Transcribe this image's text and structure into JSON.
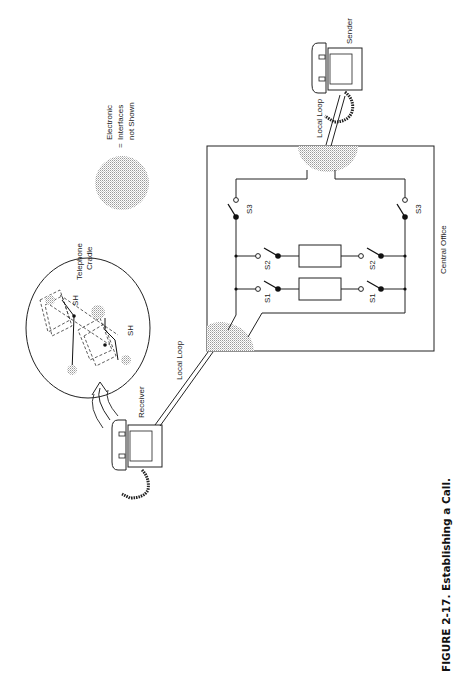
{
  "figure": {
    "caption": "FIGURE 2-17.  Establishing a Call.",
    "orientation": "rotated 90° counter-clockwise"
  },
  "legend": {
    "symbol": "stippled-circle",
    "equals": "=",
    "text_line1": "Electronic",
    "text_line2": "Interfaces",
    "text_line3": "not Shown"
  },
  "labels": {
    "receiver": "Receiver",
    "sender": "Sender",
    "local_loop_left": "Local Loop",
    "local_loop_right": "Local Loop",
    "central_office": "Central Office",
    "telephone_cradle_line1": "Telephone",
    "telephone_cradle_line2": "Cradle",
    "sh_top": "SH",
    "sh_bottom": "SH"
  },
  "switches": {
    "s1_left": "S1",
    "s1_right": "S1",
    "s2_left": "S2",
    "s2_right": "S2",
    "s3_left": "S3",
    "s3_right": "S3"
  },
  "colors": {
    "line": "#222222",
    "stipple": "#bdbdbd",
    "background": "#ffffff"
  }
}
